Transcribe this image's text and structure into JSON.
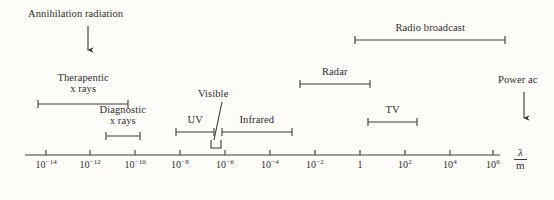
{
  "figure": {
    "type": "electromagnetic-spectrum-diagram",
    "background_color": "#fdfcf8",
    "stroke_color": "#3a3a3a",
    "axis": {
      "label_numerator": "λ",
      "label_denominator": "m",
      "scale": "logarithmic",
      "y": 155,
      "x_start": 25,
      "x_end": 500,
      "ticks": [
        {
          "base": "10",
          "exp": "-14",
          "x": 46
        },
        {
          "base": "10",
          "exp": "-12",
          "x": 90
        },
        {
          "base": "10",
          "exp": "-10",
          "x": 135
        },
        {
          "base": "10",
          "exp": "-8",
          "x": 180
        },
        {
          "base": "10",
          "exp": "-6",
          "x": 225
        },
        {
          "base": "10",
          "exp": "-4",
          "x": 270
        },
        {
          "base": "10",
          "exp": "-2",
          "x": 315
        },
        {
          "base": "1",
          "exp": "",
          "x": 360
        },
        {
          "base": "10",
          "exp": "2",
          "x": 405
        },
        {
          "base": "10",
          "exp": "4",
          "x": 450
        },
        {
          "base": "10",
          "exp": "6",
          "x": 493
        }
      ]
    },
    "bands": [
      {
        "name": "annihilation-radiation",
        "label": "Annihilation radiation",
        "marker": "arrow-down",
        "label_x": 28,
        "label_y": 8,
        "arrow_x": 88,
        "arrow_y1": 26,
        "arrow_y2": 56
      },
      {
        "name": "therapeutic-x-rays",
        "label_line1": "Therapentic",
        "label_line2": "x rays",
        "marker": "range-bar",
        "label_x": 48,
        "label_y": 72,
        "bar_x1": 38,
        "bar_x2": 128,
        "bar_y": 104
      },
      {
        "name": "diagnostic-x-rays",
        "label_line1": "Diagnostic",
        "label_line2": "x rays",
        "marker": "range-bar",
        "label_x": 88,
        "label_y": 104,
        "bar_x1": 106,
        "bar_x2": 140,
        "bar_y": 136
      },
      {
        "name": "ultraviolet",
        "label": "UV",
        "marker": "range-bar",
        "label_x": 181,
        "label_y": 114,
        "bar_x1": 176,
        "bar_x2": 214,
        "bar_y": 132
      },
      {
        "name": "visible",
        "label": "Visible",
        "marker": "leader-bracket",
        "label_x": 198,
        "label_y": 88,
        "leader_x1": 222,
        "leader_y1": 102,
        "leader_x2": 214,
        "leader_y2": 140,
        "bracket_x1": 211,
        "bracket_x2": 221,
        "bracket_y": 148,
        "bracket_depth": 8
      },
      {
        "name": "infrared",
        "label": "Infrared",
        "marker": "range-bar",
        "label_x": 235,
        "label_y": 114,
        "bar_x1": 222,
        "bar_x2": 292,
        "bar_y": 132
      },
      {
        "name": "radar",
        "label": "Radar",
        "marker": "range-bar",
        "label_x": 318,
        "label_y": 66,
        "bar_x1": 300,
        "bar_x2": 370,
        "bar_y": 84
      },
      {
        "name": "tv",
        "label": "TV",
        "marker": "range-bar",
        "label_x": 385,
        "label_y": 104,
        "bar_x1": 368,
        "bar_x2": 417,
        "bar_y": 122
      },
      {
        "name": "radio-broadcast",
        "label": "Radio broadcast",
        "marker": "range-bar",
        "label_x": 388,
        "label_y": 22,
        "bar_x1": 355,
        "bar_x2": 505,
        "bar_y": 40
      },
      {
        "name": "power-ac",
        "label": "Power ac",
        "marker": "arrow-down",
        "label_x": 498,
        "label_y": 74,
        "arrow_x": 524,
        "arrow_y1": 92,
        "arrow_y2": 124
      }
    ]
  },
  "chart_data": {
    "type": "diagram",
    "title": "",
    "xlabel": "λ / m",
    "ylabel": "",
    "scale": "log10",
    "xlim": [
      -15,
      7
    ],
    "tick_labels": [
      "10⁻¹⁴",
      "10⁻¹²",
      "10⁻¹⁰",
      "10⁻⁸",
      "10⁻⁶",
      "10⁻⁴",
      "10⁻²",
      "1",
      "10²",
      "10⁴",
      "10⁶"
    ],
    "tick_exponents": [
      -14,
      -12,
      -10,
      -8,
      -6,
      -4,
      -2,
      0,
      2,
      4,
      6
    ],
    "grid": false,
    "legend": "none",
    "annotations": [
      {
        "label": "Annihilation radiation",
        "kind": "point",
        "wavelength_exponent": -12.4
      },
      {
        "label": "Therapentic x rays",
        "kind": "range",
        "from_exponent": -14.4,
        "to_exponent": -10.4
      },
      {
        "label": "Diagnostic x rays",
        "kind": "range",
        "from_exponent": -11.3,
        "to_exponent": -9.8
      },
      {
        "label": "UV",
        "kind": "range",
        "from_exponent": -8.2,
        "to_exponent": -6.5
      },
      {
        "label": "Visible",
        "kind": "narrow-range",
        "from_exponent": -6.6,
        "to_exponent": -6.2
      },
      {
        "label": "Infrared",
        "kind": "range",
        "from_exponent": -6.1,
        "to_exponent": -3.0
      },
      {
        "label": "Radar",
        "kind": "range",
        "from_exponent": -2.7,
        "to_exponent": 0.4
      },
      {
        "label": "TV",
        "kind": "range",
        "from_exponent": 0.3,
        "to_exponent": 2.5
      },
      {
        "label": "Radio broadcast",
        "kind": "range",
        "from_exponent": -0.3,
        "to_exponent": 6.4
      },
      {
        "label": "Power ac",
        "kind": "point",
        "wavelength_exponent": 7.3
      }
    ]
  }
}
